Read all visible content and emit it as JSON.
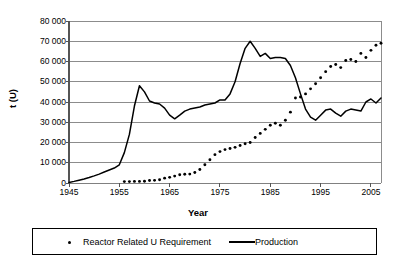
{
  "chart_data": {
    "type": "line",
    "title": "",
    "xlabel": "Year",
    "ylabel": "t (U)",
    "xlim": [
      1945,
      2007
    ],
    "ylim": [
      0,
      80000
    ],
    "grid": "horizontal",
    "legend_position": "bottom",
    "y_ticks": [
      80000,
      70000,
      60000,
      50000,
      40000,
      30000,
      20000,
      10000,
      0
    ],
    "y_tick_labels": [
      "80 000",
      "70 000",
      "60 000",
      "50 000",
      "40 000",
      "30 000",
      "20 000",
      "10 000",
      "0"
    ],
    "x_ticks": [
      1945,
      1955,
      1965,
      1975,
      1985,
      1995,
      2005
    ],
    "x_tick_labels": [
      "1945",
      "1955",
      "1965",
      "1975",
      "1985",
      "1995",
      "2005"
    ],
    "series": [
      {
        "name": "Reactor Related U Requirement",
        "marker": "dot",
        "style": "markers-only",
        "color": "#000000",
        "x": [
          1956,
          1957,
          1958,
          1959,
          1960,
          1961,
          1962,
          1963,
          1964,
          1965,
          1966,
          1967,
          1968,
          1969,
          1970,
          1971,
          1972,
          1973,
          1974,
          1975,
          1976,
          1977,
          1978,
          1979,
          1980,
          1981,
          1982,
          1983,
          1984,
          1985,
          1986,
          1987,
          1988,
          1989,
          1990,
          1991,
          1992,
          1993,
          1994,
          1995,
          1996,
          1997,
          1998,
          1999,
          2000,
          2001,
          2002,
          2003,
          2004,
          2005,
          2006,
          2007
        ],
        "y": [
          700,
          700,
          800,
          800,
          900,
          1200,
          1300,
          1600,
          2400,
          2800,
          3400,
          4100,
          4300,
          4400,
          5200,
          6700,
          9000,
          11500,
          14000,
          15500,
          16500,
          17000,
          17600,
          18500,
          19400,
          20000,
          22500,
          24500,
          26500,
          28500,
          29500,
          28500,
          31000,
          35000,
          42000,
          42500,
          44000,
          46500,
          49000,
          52000,
          55000,
          57500,
          58500,
          57000,
          60500,
          61000,
          60000,
          64000,
          62000,
          65500,
          68000,
          69000
        ]
      },
      {
        "name": "Production",
        "marker": "none",
        "style": "line",
        "color": "#000000",
        "x": [
          1945,
          1946,
          1947,
          1948,
          1949,
          1950,
          1951,
          1952,
          1953,
          1954,
          1955,
          1956,
          1957,
          1958,
          1959,
          1960,
          1961,
          1962,
          1963,
          1964,
          1965,
          1966,
          1967,
          1968,
          1969,
          1970,
          1971,
          1972,
          1973,
          1974,
          1975,
          1976,
          1977,
          1978,
          1979,
          1980,
          1981,
          1982,
          1983,
          1984,
          1985,
          1986,
          1987,
          1988,
          1989,
          1990,
          1991,
          1992,
          1993,
          1994,
          1995,
          1996,
          1997,
          1998,
          1999,
          2000,
          2001,
          2002,
          2003,
          2004,
          2005,
          2006,
          2007
        ],
        "y": [
          300,
          800,
          1400,
          2000,
          2700,
          3500,
          4400,
          5400,
          6400,
          7400,
          9000,
          15000,
          24000,
          38000,
          48000,
          45000,
          40500,
          39500,
          39000,
          37000,
          33500,
          31700,
          33500,
          35500,
          36500,
          37000,
          37500,
          38500,
          39000,
          39500,
          41000,
          41000,
          44000,
          50000,
          59000,
          66500,
          70000,
          66500,
          62500,
          64000,
          61500,
          62000,
          62000,
          61500,
          58000,
          52000,
          44000,
          36500,
          32500,
          31000,
          33500,
          36000,
          36500,
          34500,
          33000,
          35500,
          36500,
          36000,
          35500,
          40000,
          41500,
          39500,
          42000
        ]
      }
    ]
  },
  "axis": {
    "y_title": "t (U)",
    "x_title": "Year"
  },
  "legend": {
    "items": [
      {
        "label": "Reactor Related U Requirement",
        "symbol": "dot-marker"
      },
      {
        "label": "Production",
        "symbol": "solid-line"
      }
    ]
  }
}
